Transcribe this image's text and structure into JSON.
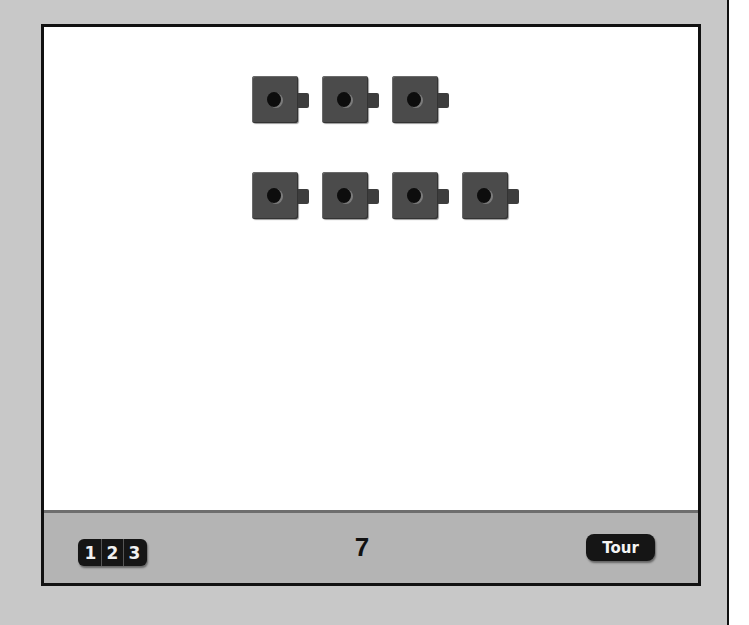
{
  "game": {
    "rows": [
      {
        "block_count": 3
      },
      {
        "block_count": 4
      }
    ],
    "total": "7",
    "block_color": "#4b4b4b"
  },
  "toolbar": {
    "number_button_digits": [
      "1",
      "2",
      "3"
    ],
    "count_display": "7",
    "tour_label": "Tour"
  }
}
